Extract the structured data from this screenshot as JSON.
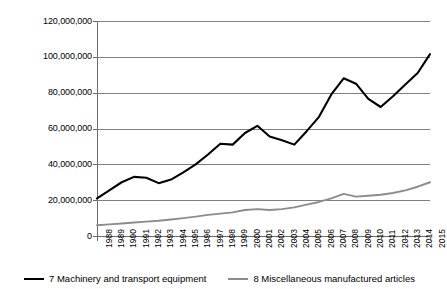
{
  "chart_data": {
    "type": "line",
    "title": "",
    "xlabel": "",
    "ylabel": "",
    "grid": true,
    "legend_position": "bottom",
    "ylim": [
      0,
      120000000
    ],
    "yticks": [
      0,
      20000000,
      40000000,
      60000000,
      80000000,
      100000000,
      120000000
    ],
    "ytick_labels": [
      "0",
      "20,000,000",
      "40,000,000",
      "60,000,000",
      "80,000,000",
      "100,000,000",
      "120,000,000"
    ],
    "categories": [
      "1988",
      "1989",
      "1990",
      "1991",
      "1992",
      "1993",
      "1994",
      "1995",
      "1996",
      "1997",
      "1998",
      "1999",
      "2000",
      "2001",
      "2002",
      "2003",
      "2004",
      "2005",
      "2006",
      "2007",
      "2008",
      "2009",
      "2010",
      "2011",
      "2012",
      "2013",
      "2014",
      "2015"
    ],
    "series": [
      {
        "name": "7 Machinery and transport equipment",
        "color": "#000000",
        "values": [
          21000000,
          25500000,
          30000000,
          33000000,
          32500000,
          29500000,
          31500000,
          35500000,
          40000000,
          45500000,
          51500000,
          51000000,
          57500000,
          61500000,
          55500000,
          53500000,
          51000000,
          58500000,
          66500000,
          79000000,
          88000000,
          85000000,
          76500000,
          72000000,
          78000000,
          84500000,
          91000000,
          101500000
        ]
      },
      {
        "name": "8 Miscellaneous manufactured articles",
        "color": "#8c8c8c",
        "values": [
          6000000,
          6500000,
          7000000,
          7500000,
          8000000,
          8500000,
          9200000,
          10000000,
          10800000,
          11800000,
          12500000,
          13200000,
          14500000,
          15000000,
          14500000,
          15000000,
          16000000,
          17500000,
          19000000,
          21000000,
          23500000,
          22000000,
          22500000,
          23000000,
          24000000,
          25500000,
          27500000,
          30000000
        ]
      }
    ]
  },
  "legend": {
    "items": [
      {
        "label": "7 Machinery and transport equipment",
        "color": "#000000"
      },
      {
        "label": "8 Miscellaneous manufactured articles",
        "color": "#8c8c8c"
      }
    ]
  }
}
